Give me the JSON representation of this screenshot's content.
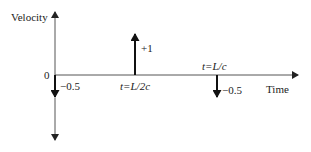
{
  "diagram": {
    "y_axis_label": "Velocity",
    "x_axis_label": "Time",
    "origin_label": "0",
    "impulses": [
      {
        "time_label": "t=0",
        "value_label": "−0.5",
        "value": -0.5
      },
      {
        "time_label": "t=L/2c",
        "value_label": "+1",
        "value": 1
      },
      {
        "time_label": "t=L/c",
        "value_label": "−0.5",
        "value": -0.5
      }
    ],
    "colors": {
      "axis": "#444444",
      "impulse": "#111111",
      "background": "#ffffff"
    }
  }
}
